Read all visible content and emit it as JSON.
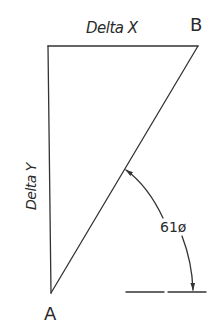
{
  "diagram": {
    "type": "right-triangle-angle-illustration",
    "labels": {
      "delta_x": "Delta X",
      "delta_y": "Delta Y",
      "vertex_a": "A",
      "vertex_b": "B",
      "angle": "61ø"
    },
    "vertices": {
      "top_left": [
        48,
        46
      ],
      "b": [
        198,
        46
      ],
      "a": [
        51,
        293
      ]
    },
    "baseline_segments": [
      [
        [
          126,
          292
        ],
        [
          164,
          292
        ]
      ],
      [
        [
          168,
          292
        ],
        [
          206,
          292
        ]
      ]
    ],
    "colors": {
      "line": "#333333",
      "text": "#2a2a2a",
      "background": "#ffffff"
    }
  }
}
